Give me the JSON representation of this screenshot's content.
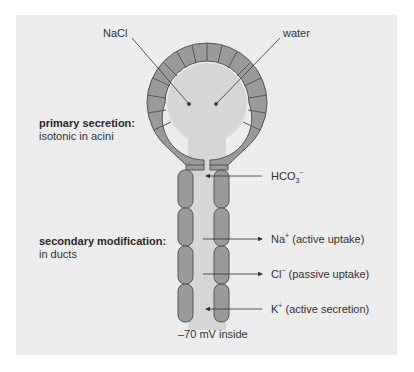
{
  "figure": {
    "background": "#ececec",
    "cell_fill": "#9a9a9a",
    "cell_stroke": "#555555",
    "lumen_fill": "#d6d6d6",
    "acinus": {
      "inputs": [
        {
          "label": "NaCl",
          "direction": "into lumen"
        },
        {
          "label": "water",
          "direction": "into lumen"
        }
      ]
    },
    "annotations": {
      "primary_title": "primary secretion:",
      "primary_sub": "isotonic in acini",
      "secondary_title": "secondary modification:",
      "secondary_sub": "in ducts"
    },
    "duct_transports": [
      {
        "ion": "HCO",
        "sub": "3",
        "sup": "−",
        "note": "",
        "direction": "into lumen"
      },
      {
        "ion": "Na",
        "sub": "",
        "sup": "+",
        "note": " (active uptake)",
        "direction": "out of lumen"
      },
      {
        "ion": "Cl",
        "sub": "",
        "sup": "−",
        "note": " (passive uptake)",
        "direction": "out of lumen"
      },
      {
        "ion": "K",
        "sub": "",
        "sup": "+",
        "note": " (active secretion)",
        "direction": "into lumen"
      }
    ],
    "potential_label": "–70 mV inside"
  }
}
